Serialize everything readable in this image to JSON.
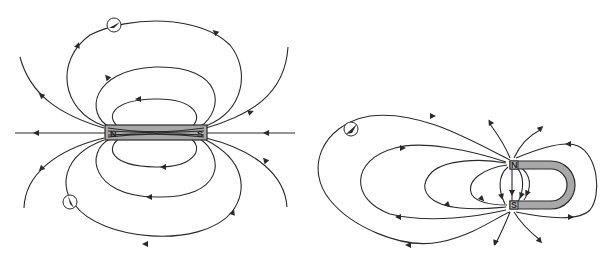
{
  "figure": {
    "bar_magnet": {
      "north_label": "N",
      "south_label": "S",
      "compass_count": 2,
      "field_direction": "N to S outside magnet"
    },
    "horseshoe_magnet": {
      "north_label": "N",
      "south_label": "S",
      "compass_count": 1,
      "field_direction": "N to S outside magnet"
    },
    "colors": {
      "line": "#2a2a2a",
      "magnet_fill": "#a8a8a8",
      "background": "#ffffff"
    }
  }
}
